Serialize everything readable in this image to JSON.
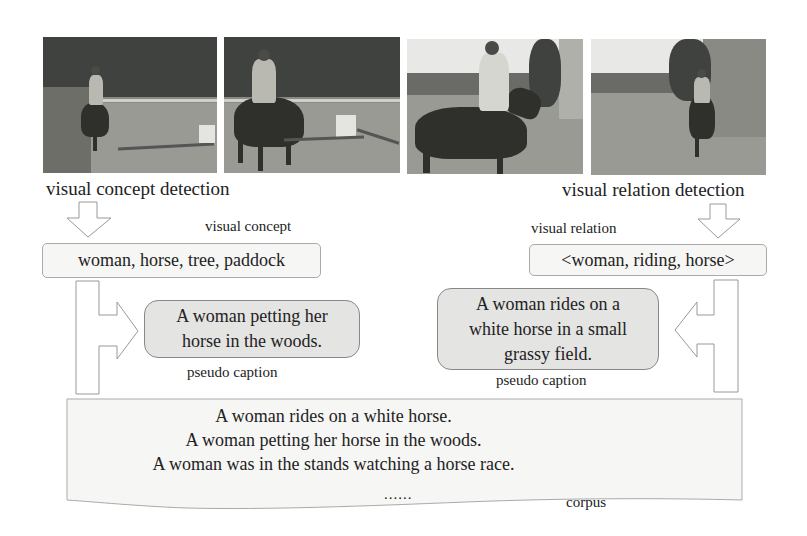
{
  "images": [
    {
      "name": "photo-1",
      "description": "woman riding dark horse near jump, trees behind"
    },
    {
      "name": "photo-2",
      "description": "woman riding dark horse past jump pole"
    },
    {
      "name": "photo-3",
      "description": "woman riding horse, side view, near building"
    },
    {
      "name": "photo-4",
      "description": "rider on horse along wall in arena"
    }
  ],
  "left_branch": {
    "detection_label": "visual concept detection",
    "output_label": "visual concept",
    "output_value": "woman, horse, tree, paddock",
    "caption": "A woman petting her horse in the woods.",
    "caption_lines": [
      "A woman petting her",
      "horse in the woods."
    ],
    "caption_label": "pseudo caption"
  },
  "right_branch": {
    "detection_label": "visual relation detection",
    "output_label": "visual relation",
    "output_value": "<woman, riding, horse>",
    "caption_lines": [
      "A woman rides on a",
      "white horse in a small",
      "grassy field."
    ],
    "caption_label": "pseudo caption"
  },
  "corpus": {
    "lines": [
      "A woman rides on a white horse.",
      "A woman petting her horse in the woods.",
      "A woman was in the stands watching a horse race."
    ],
    "ellipsis": "......",
    "label": "corpus"
  },
  "colors": {
    "box_fill": "#f6f6f4",
    "caption_fill": "#e4e4e2",
    "outline": "#999999",
    "text": "#222222"
  }
}
